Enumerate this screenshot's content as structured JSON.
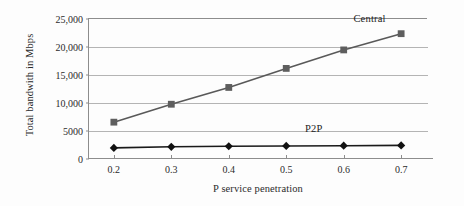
{
  "chart_data": {
    "type": "line",
    "title": "",
    "xlabel": "P service penetration",
    "ylabel": "Total bandwith in Mbps",
    "x": [
      0.2,
      0.3,
      0.4,
      0.5,
      0.6,
      0.7
    ],
    "xtick_labels": [
      "0.2",
      "0.3",
      "0.4",
      "0.5",
      "0.6",
      "0.7"
    ],
    "xlim": [
      0.155,
      0.745
    ],
    "ylim": [
      0,
      25000
    ],
    "ytick_labels": [
      "0",
      "5000",
      "10,000",
      "15,000",
      "20,000",
      "25,000"
    ],
    "ytick_values": [
      0,
      5000,
      10000,
      15000,
      20000,
      25000
    ],
    "grid": "horizontal",
    "legend_position": "inline-annotation",
    "series": [
      {
        "name": "Central",
        "marker": "square",
        "color": "#5e5e5e",
        "line_color": "#595959",
        "values": [
          6400,
          9600,
          12600,
          16000,
          19300,
          22200
        ],
        "annotation": "Central",
        "annotation_x": 0.645,
        "annotation_y": 25000
      },
      {
        "name": "P2P",
        "marker": "diamond",
        "color": "#111111",
        "line_color": "#1a1a1a",
        "values": [
          1800,
          2000,
          2100,
          2150,
          2200,
          2250
        ],
        "annotation": "P2P",
        "annotation_x": 0.548,
        "annotation_y": 5350
      }
    ]
  }
}
